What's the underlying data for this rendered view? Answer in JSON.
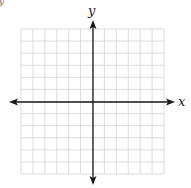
{
  "diagram": {
    "type": "coordinate-plane",
    "corner_fragment": "y",
    "x_axis_label": "x",
    "y_axis_label": "y",
    "grid": {
      "columns": 12,
      "rows": 12,
      "left": 21,
      "top": 29,
      "right": 164,
      "bottom": 174,
      "line_color": "#d4d4d4"
    },
    "axes": {
      "color": "#1a1a1a",
      "origin_x": 93,
      "origin_y": 102
    }
  }
}
